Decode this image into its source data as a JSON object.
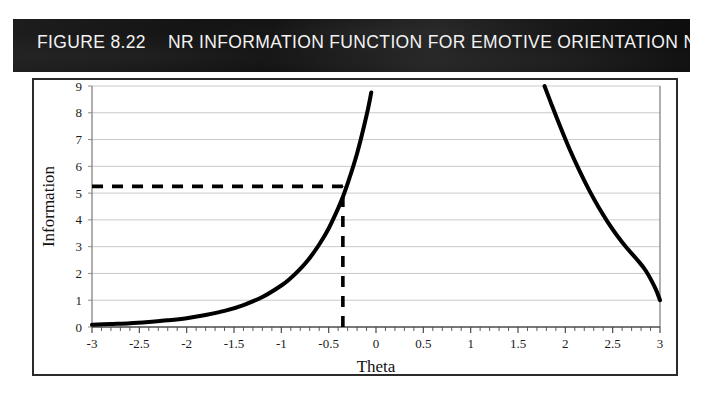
{
  "figure": {
    "number_label": "FIGURE 8.22",
    "title": "NR INFORMATION FUNCTION FOR EMOTIVE ORIENTATION NEEDS SCALE",
    "title_bar_color": "#181818",
    "title_text_color": "#f2f2f2",
    "border_color": "#2b2b2b",
    "background_color": "#ffffff"
  },
  "chart_data": {
    "type": "line",
    "title": "NR INFORMATION FUNCTION FOR EMOTIVE ORIENTATION NEEDS SCALE",
    "xlabel": "Theta",
    "ylabel": "Information",
    "xlim": [
      -3,
      3
    ],
    "ylim": [
      0,
      9
    ],
    "grid": true,
    "grid_axis": "y",
    "legend": null,
    "line_color": "#000000",
    "line_width": 4,
    "grid_color": "#c9c9c9",
    "xticks": [
      -3,
      -2.5,
      -2,
      -1.5,
      -1,
      -0.5,
      0,
      0.5,
      1,
      1.5,
      2,
      2.5,
      3
    ],
    "xtick_labels": [
      "-3",
      "-2.5",
      "-2",
      "-1.5",
      "-1",
      "-0.5",
      "0",
      "0.5",
      "1",
      "1.5",
      "2",
      "2.5",
      "3"
    ],
    "yticks": [
      0,
      1,
      2,
      3,
      4,
      5,
      6,
      7,
      8,
      9
    ],
    "ytick_labels": [
      "0",
      "1",
      "2",
      "3",
      "4",
      "5",
      "6",
      "7",
      "8",
      "9"
    ],
    "minor_xtick_step": 0.1,
    "series": [
      {
        "name": "information-curve-left",
        "x": [
          -3.0,
          -2.8,
          -2.6,
          -2.4,
          -2.2,
          -2.0,
          -1.8,
          -1.6,
          -1.4,
          -1.2,
          -1.0,
          -0.9,
          -0.8,
          -0.7,
          -0.6,
          -0.5,
          -0.4,
          -0.35,
          -0.3,
          -0.2,
          -0.1,
          -0.05
        ],
        "y": [
          0.08,
          0.11,
          0.14,
          0.19,
          0.25,
          0.33,
          0.45,
          0.6,
          0.82,
          1.12,
          1.55,
          1.83,
          2.17,
          2.58,
          3.08,
          3.68,
          4.43,
          4.86,
          5.35,
          6.48,
          7.9,
          8.76
        ]
      },
      {
        "name": "information-curve-right",
        "x": [
          1.78,
          1.85,
          1.95,
          2.05,
          2.15,
          2.25,
          2.35,
          2.45,
          2.55,
          2.65,
          2.75,
          2.85,
          2.95,
          3.0
        ],
        "y": [
          9.0,
          8.35,
          7.45,
          6.6,
          5.83,
          5.12,
          4.48,
          3.91,
          3.4,
          2.95,
          2.55,
          2.1,
          1.45,
          1.0
        ]
      }
    ],
    "annotations": [
      {
        "name": "reference-line-horizontal",
        "type": "dashed-horizontal",
        "y": 5.25,
        "x_from": -3.0,
        "x_to": -0.35,
        "color": "#000000"
      },
      {
        "name": "reference-line-vertical",
        "type": "dashed-vertical",
        "x": -0.35,
        "y_from": 0,
        "y_to": 5.25,
        "color": "#000000"
      }
    ],
    "reference_point": {
      "theta": -0.35,
      "information": 5.25
    }
  }
}
